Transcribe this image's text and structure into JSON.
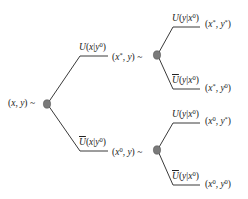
{
  "diagram": {
    "type": "decision-tree",
    "colors": {
      "line": "#3a3a3a",
      "node_fill": "#7a7a7a",
      "node_stroke": "#555555",
      "text": "#222222"
    },
    "root": {
      "label": "(x, y) ~",
      "branches": [
        {
          "label": "U(x|y0)",
          "node_label": "(x*, y) ~",
          "branches": [
            {
              "label": "U(y|x0)",
              "outcome": "(x*, y*)"
            },
            {
              "label": "Ū(y|x0)",
              "outcome": "(x*, y0)"
            }
          ]
        },
        {
          "label": "Ū(x|y0)",
          "node_label": "(x0, y) ~",
          "branches": [
            {
              "label": "U(y|x0)",
              "outcome": "(x0, y*)"
            },
            {
              "label": "Ū(y|x0)",
              "outcome": "(x0, y0)"
            }
          ]
        }
      ]
    }
  }
}
